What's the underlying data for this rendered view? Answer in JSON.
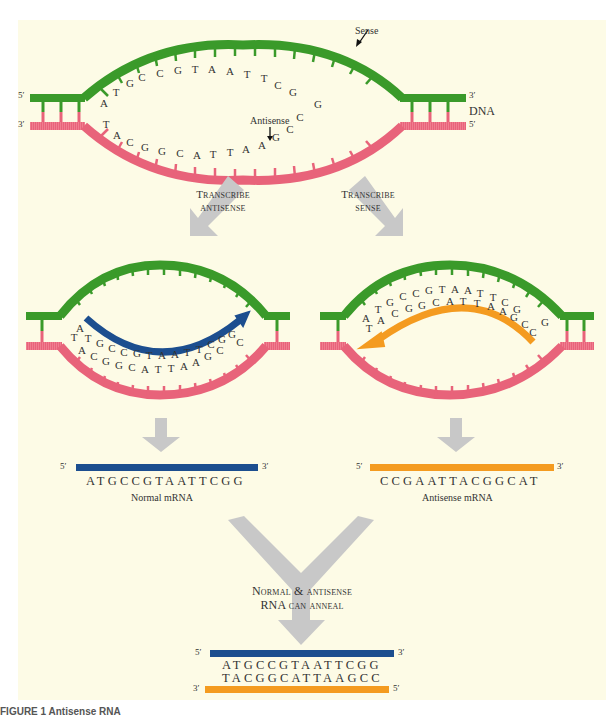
{
  "colors": {
    "background": "#fdfbe6",
    "sense_strand": "#3a9a2a",
    "antisense_strand": "#e8637a",
    "normal_mrna": "#1c4e8f",
    "antisense_mrna": "#f49b20",
    "process_arrow": "#c8c8c8"
  },
  "top_dna": {
    "label": "DNA",
    "sense_label": "Sense",
    "antisense_label": "Antisense",
    "left_top_end": "5′",
    "left_bottom_end": "3′",
    "right_top_end": "3′",
    "right_bottom_end": "5′",
    "sense_bases": [
      "A",
      "T",
      "G",
      "C",
      "C",
      "G",
      "T",
      "A",
      "A",
      "T",
      "T",
      "C",
      "G",
      "G"
    ],
    "antisense_bases": [
      "T",
      "A",
      "C",
      "G",
      "G",
      "C",
      "A",
      "T",
      "T",
      "A",
      "A",
      "G",
      "C",
      "C"
    ]
  },
  "steps": {
    "transcribe_antisense_line1": "Transcribe",
    "transcribe_antisense_line2": "antisense",
    "transcribe_sense_line1": "Transcribe",
    "transcribe_sense_line2": "sense",
    "anneal_line1": "Normal & antisense",
    "anneal_line2": "RNA can anneal"
  },
  "left_bubble": {
    "new_strand": [
      "A",
      "T",
      "G",
      "C",
      "C",
      "G",
      "T",
      "A",
      "A",
      "T",
      "T",
      "C",
      "G",
      "G"
    ],
    "template": [
      "T",
      "A",
      "C",
      "G",
      "G",
      "C",
      "A",
      "T",
      "T",
      "A",
      "A",
      "G",
      "C",
      "C"
    ]
  },
  "right_bubble": {
    "template": [
      "A",
      "T",
      "G",
      "C",
      "C",
      "G",
      "T",
      "A",
      "A",
      "T",
      "T",
      "C",
      "G",
      "G"
    ],
    "new_strand": [
      "T",
      "A",
      "C",
      "G",
      "G",
      "C",
      "A",
      "T",
      "T",
      "A",
      "A",
      "G",
      "C",
      "C"
    ]
  },
  "normal_mrna": {
    "end5": "5′",
    "end3": "3′",
    "sequence": "ATGCCGTAATTCGG",
    "label": "Normal mRNA"
  },
  "antisense_mrna": {
    "end5": "5′",
    "end3": "3′",
    "sequence": "CCGAATTACGGCAT",
    "label": "Antisense mRNA"
  },
  "duplex": {
    "top_end5": "5′",
    "top_end3": "3′",
    "top_sequence": "ATGCCGTAATTCGG",
    "bottom_sequence": "TACGGCATTAAGCC",
    "bottom_end3": "3′",
    "bottom_end5": "5′"
  },
  "caption": "FIGURE 1 Antisense RNA"
}
